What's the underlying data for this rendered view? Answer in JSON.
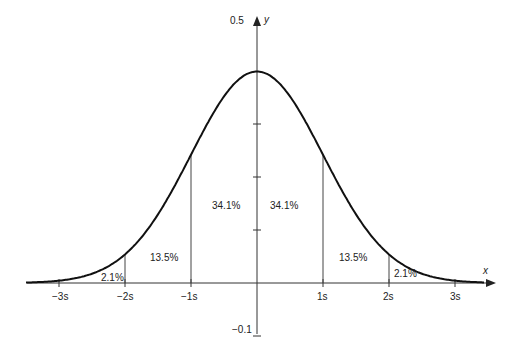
{
  "chart_data": {
    "type": "line",
    "xlabel": "x",
    "ylabel": "y",
    "y_ticks": [
      {
        "label": "0.5",
        "value": 0.5
      },
      {
        "label": "-0.1",
        "value": -0.1
      }
    ],
    "x_ticks": [
      {
        "label": "−3s",
        "value": -3
      },
      {
        "label": "−2s",
        "value": -2
      },
      {
        "label": "−1s",
        "value": -1
      },
      {
        "label": "1s",
        "value": 1
      },
      {
        "label": "2s",
        "value": 2
      },
      {
        "label": "3s",
        "value": 3
      }
    ],
    "ylim": [
      -0.1,
      0.5
    ],
    "xlim": [
      -3.5,
      3.6
    ],
    "curve": {
      "mean": 0,
      "sd": 1,
      "peak": 0.4
    },
    "regions": [
      {
        "label": "2.1%",
        "from": -3,
        "to": -2
      },
      {
        "label": "13.5%",
        "from": -2,
        "to": -1
      },
      {
        "label": "34.1%",
        "from": -1,
        "to": 0
      },
      {
        "label": "34.1%",
        "from": 0,
        "to": 1
      },
      {
        "label": "13.5%",
        "from": 1,
        "to": 2
      },
      {
        "label": "2.1%",
        "from": 2,
        "to": 3
      }
    ],
    "grid": false,
    "legend": null
  },
  "axes": {
    "y_label": "y",
    "x_label": "x",
    "y_top": "0.5",
    "y_bottom": "−0.1"
  },
  "xticks": [
    "−3s",
    "−2s",
    "−1s",
    "1s",
    "2s",
    "3s"
  ],
  "regions": [
    "2.1%",
    "13.5%",
    "34.1%",
    "34.1%",
    "13.5%",
    "2.1%"
  ]
}
